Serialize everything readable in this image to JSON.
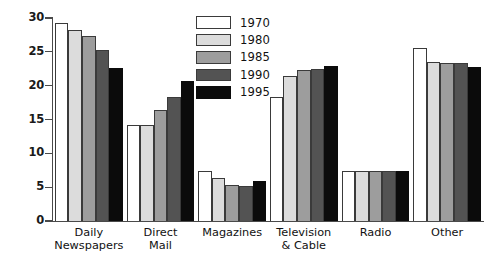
{
  "chart_data": {
    "type": "bar",
    "title": "",
    "subtitle": "",
    "xlabel": "",
    "ylabel": "",
    "ylim": [
      0,
      30
    ],
    "ytick_labels": [
      "0",
      "5",
      "10",
      "15",
      "20",
      "25",
      "30"
    ],
    "ytick_values": [
      0,
      5,
      10,
      15,
      20,
      25,
      30
    ],
    "grid": false,
    "legend_position": "top-center",
    "categories": [
      "Daily Newspapers",
      "Direct Mail",
      "Magazines",
      "Television & Cable",
      "Radio",
      "Other"
    ],
    "category_lines": [
      [
        "Daily",
        "Newspapers"
      ],
      [
        "Direct",
        "Mail"
      ],
      [
        "Magazines"
      ],
      [
        "Television",
        "& Cable"
      ],
      [
        "Radio"
      ],
      [
        "Other"
      ]
    ],
    "series": [
      {
        "name": "1970",
        "color": "#ffffff",
        "values": [
          29.3,
          14.2,
          7.4,
          18.4,
          7.4,
          25.5
        ]
      },
      {
        "name": "1980",
        "color": "#dcdcdc",
        "values": [
          28.2,
          14.2,
          6.3,
          21.5,
          7.4,
          23.5
        ]
      },
      {
        "name": "1985",
        "color": "#9d9d9d",
        "values": [
          27.4,
          16.4,
          5.3,
          22.3,
          7.4,
          23.4
        ]
      },
      {
        "name": "1990",
        "color": "#535353",
        "values": [
          25.2,
          18.3,
          5.2,
          22.4,
          7.4,
          23.4
        ]
      },
      {
        "name": "1995",
        "color": "#0b0b0b",
        "values": [
          22.6,
          20.7,
          5.9,
          22.9,
          7.4,
          22.8
        ]
      }
    ]
  },
  "legend": {
    "entries": [
      "1970",
      "1980",
      "1985",
      "1990",
      "1995"
    ]
  }
}
